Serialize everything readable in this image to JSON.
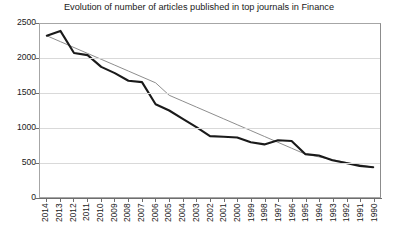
{
  "chart_data": {
    "type": "line",
    "title": "Evolution of number of articles published in top journals in Finance",
    "xlabel": "",
    "ylabel": "",
    "ylim": [
      0,
      2500
    ],
    "yticks": [
      0,
      500,
      1000,
      1500,
      2000,
      2500
    ],
    "ytick_labels": [
      "0",
      "500",
      "1000",
      "1500",
      "2000",
      "2500"
    ],
    "grid": true,
    "legend": "none",
    "categories": [
      "2014",
      "2013",
      "2012",
      "2011",
      "2010",
      "2009",
      "2008",
      "2007",
      "2006",
      "2005",
      "2004",
      "2003",
      "2002",
      "2001",
      "2000",
      "1999",
      "1998",
      "1997",
      "1996",
      "1995",
      "1994",
      "1993",
      "1992",
      "1991",
      "1990"
    ],
    "series": [
      {
        "name": "Number of articles",
        "style": "thick-line",
        "color": "#1a1a1a",
        "values": [
          2330,
          2400,
          2080,
          2050,
          1880,
          1790,
          1680,
          1660,
          1340,
          1250,
          1130,
          1010,
          880,
          870,
          860,
          790,
          760,
          820,
          810,
          620,
          600,
          530,
          490,
          450,
          430
        ]
      },
      {
        "name": "Linear trend",
        "style": "thin-trendline",
        "color": "#808080",
        "values": [
          2330,
          2245,
          2160,
          2075,
          1990,
          1905,
          1820,
          1735,
          1650,
          1470,
          1385,
          1300,
          1215,
          1130,
          1045,
          960,
          875,
          790,
          705,
          620,
          580,
          540,
          500,
          465,
          430
        ]
      }
    ]
  },
  "axis": {
    "y_tick_labels": [
      "2500",
      "2000",
      "1500",
      "1000",
      "500",
      "0"
    ],
    "x_tick_labels": [
      "2014",
      "2013",
      "2012",
      "2011",
      "2010",
      "2009",
      "2008",
      "2007",
      "2006",
      "2005",
      "2004",
      "2003",
      "2002",
      "2001",
      "2000",
      "1999",
      "1998",
      "1997",
      "1996",
      "1995",
      "1994",
      "1993",
      "1992",
      "1991",
      "1990"
    ]
  }
}
